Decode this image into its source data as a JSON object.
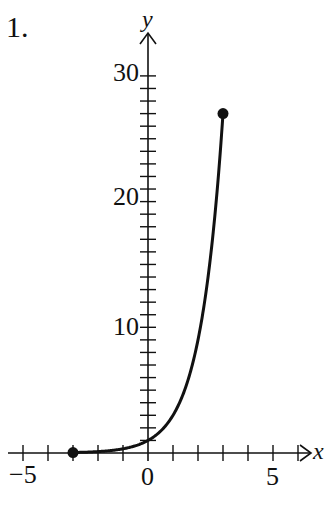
{
  "problem_label": "1.",
  "chart_data": {
    "type": "line",
    "title": "",
    "function": "y = 3^x",
    "xlabel": "x",
    "ylabel": "y",
    "xlim": [
      -5.5,
      6.5
    ],
    "ylim": [
      0,
      31.5
    ],
    "x_ticks_major": [
      -5,
      0,
      5
    ],
    "x_tick_step": 1,
    "y_ticks_major": [
      10,
      20,
      30
    ],
    "y_tick_step": 1,
    "domain": [
      -3,
      3
    ],
    "endpoints": [
      {
        "x": -3,
        "y": 0.037,
        "filled": true
      },
      {
        "x": 3,
        "y": 27,
        "filled": true
      }
    ],
    "x": [
      -3,
      -2,
      -1,
      0,
      1,
      2,
      2.5,
      3
    ],
    "y": [
      0.037,
      0.111,
      0.333,
      1,
      3,
      9,
      15.59,
      27
    ],
    "grid": false,
    "legend": null
  },
  "axis_labels": {
    "x_tick_neg5": "−5",
    "x_tick_0": "0",
    "x_tick_5": "5",
    "y_tick_10": "10",
    "y_tick_20": "20",
    "y_tick_30": "30",
    "x_name": "x",
    "y_name": "y"
  },
  "colors": {
    "ink": "#111111",
    "background": "#ffffff"
  }
}
